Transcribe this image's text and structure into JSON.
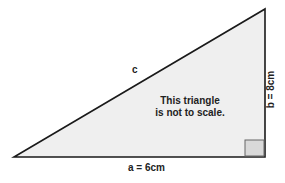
{
  "diagram": {
    "type": "right-triangle",
    "labels": {
      "hypotenuse": "c",
      "base": "a = 6cm",
      "height": "b = 8cm"
    },
    "note": {
      "line1": "This triangle",
      "line2": "is not to scale."
    },
    "colors": {
      "fill": "#efefef",
      "stroke": "#1a1a1a",
      "right_angle_fill": "#d9d9d9"
    }
  }
}
